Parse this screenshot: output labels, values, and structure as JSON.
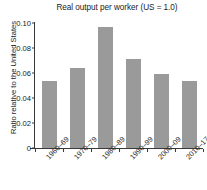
{
  "chart_data": {
    "type": "bar",
    "title": "Real output per worker (US = 1.0)",
    "xlabel": "",
    "ylabel": "Ratio relative to the United States",
    "categories": [
      "1960–69",
      "1970–79",
      "1980–89",
      "1990–99",
      "2000–09",
      "2010–17"
    ],
    "values": [
      0.054,
      0.064,
      0.097,
      0.071,
      0.059,
      0.054
    ],
    "ylim": [
      0,
      0.1
    ],
    "yticks": [
      0,
      0.02,
      0.04,
      0.06,
      0.08,
      0.1
    ],
    "ytick_labels": [
      "0",
      "0.02",
      "0.04",
      "0.06",
      "0.08",
      "0.10"
    ],
    "grid": false,
    "legend": null,
    "bar_color": "#9a9a9a",
    "axis_color": "#3a3a3a",
    "background": "#ffffff"
  }
}
